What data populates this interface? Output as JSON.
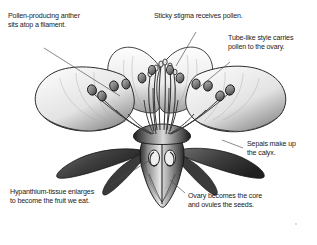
{
  "figure": {
    "title_text": "",
    "background_color": "#ffffff",
    "ink_color": "#1b1b1b",
    "leader_color": "#4a4a4a"
  },
  "labels": {
    "anther": "Pollen-producing anther\nsits atop a filament.",
    "stigma": "Sticky stigma receives pollen.",
    "style": "Tube-like style carries\npollen to the ovary.",
    "sepals": "Sepals make up\nthe calyx.",
    "hypanthium": "Hypanthium-tissue enlarges\nto become the fruit we eat.",
    "ovary": "Ovary becomes the core\nand ovules the seeds."
  },
  "parts": [
    {
      "name": "anther",
      "label_ref": "anther"
    },
    {
      "name": "stigma",
      "label_ref": "stigma"
    },
    {
      "name": "style",
      "label_ref": "style"
    },
    {
      "name": "sepals",
      "label_ref": "sepals"
    },
    {
      "name": "hypanthium",
      "label_ref": "hypanthium"
    },
    {
      "name": "ovary",
      "label_ref": "ovary"
    }
  ]
}
